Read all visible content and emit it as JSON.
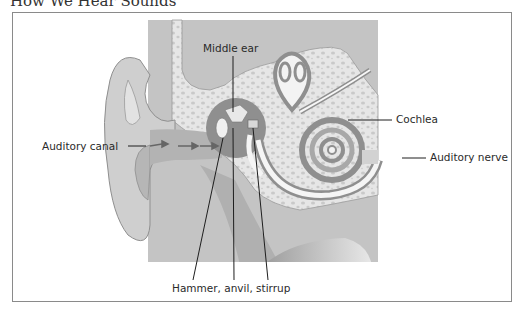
{
  "page": {
    "heading": "How We Hear Sounds"
  },
  "diagram": {
    "labels": {
      "middle_ear": "Middle ear",
      "auditory_canal": "Auditory canal",
      "cochlea": "Cochlea",
      "auditory_nerve": "Auditory nerve",
      "ossicles": "Hammer, anvil, stirrup"
    },
    "colors": {
      "tissue": "#bdbdbd",
      "bone": "#e6e6e6",
      "bone_pores": "#c7c7c7",
      "dark": "#8f8f8f",
      "outline": "#7a7a7a",
      "leader_line": "#1e1e1e",
      "frame": "#8a8a8a"
    }
  }
}
